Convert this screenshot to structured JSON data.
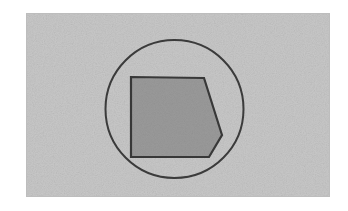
{
  "figure": {
    "title": "Pentagon inscribed in circle on gray panel",
    "canvas": {
      "width": 348,
      "height": 211,
      "background_color": "#ffffff"
    },
    "panel": {
      "label": "gray paper panel",
      "x": 26,
      "y": 13,
      "width": 304,
      "height": 184,
      "fill_color": "#c8c8c8",
      "edge_color": "#bdbdbd",
      "texture": "paper-grain"
    },
    "circle": {
      "label": "outline circle",
      "center_x": 174.5,
      "center_y": 109,
      "radius": 69,
      "stroke_color": "#3a3a3a",
      "stroke_width": 2,
      "fill": "none"
    },
    "polygon": {
      "label": "filled pentagon",
      "sides": 5,
      "fill_color": "#9a9a9a",
      "stroke_color": "#383838",
      "stroke_width": 2.2,
      "points": "131,77 204,78 222,135 209,157 131,157",
      "vertices": [
        {
          "name": "top-left",
          "x": 131,
          "y": 77
        },
        {
          "name": "top-right",
          "x": 204,
          "y": 78
        },
        {
          "name": "right-point",
          "x": 222,
          "y": 135
        },
        {
          "name": "bottom-right",
          "x": 209,
          "y": 157
        },
        {
          "name": "bottom-left",
          "x": 131,
          "y": 157
        }
      ]
    }
  }
}
